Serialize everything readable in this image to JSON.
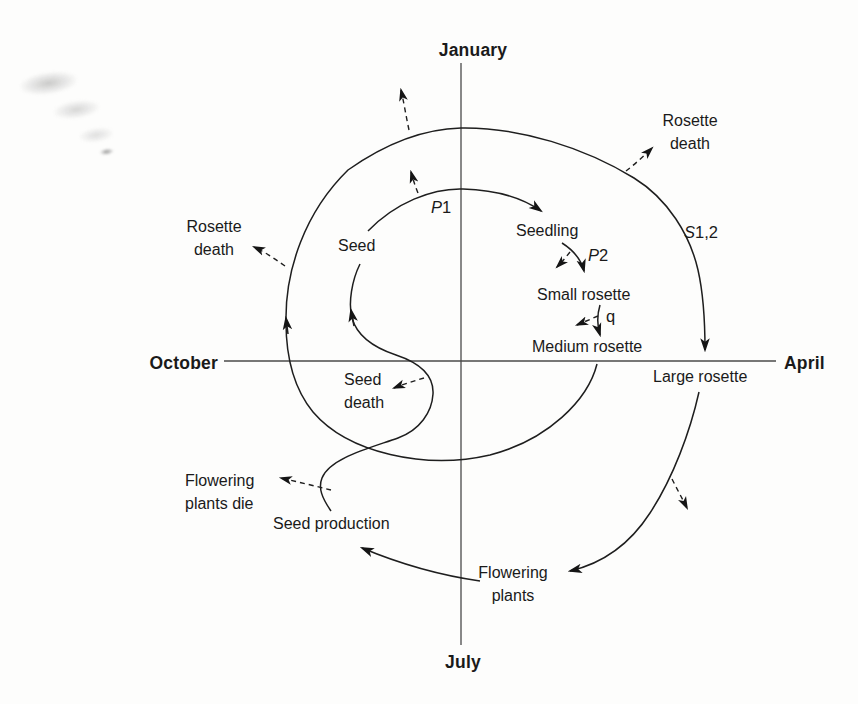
{
  "months": {
    "top": "January",
    "right": "April",
    "bottom": "July",
    "left": "October"
  },
  "stages": {
    "seed": "Seed",
    "seedling": "Seedling",
    "small_rosette": "Small rosette",
    "medium_rosette": "Medium rosette",
    "large_rosette": "Large rosette",
    "flowering_plants": "Flowering plants",
    "seed_production": "Seed production"
  },
  "transitions": {
    "p1": {
      "italic": "P",
      "normal": "1"
    },
    "p2": {
      "italic": "P",
      "normal": "2"
    },
    "q": {
      "italic": "",
      "normal": "q"
    },
    "s12": {
      "italic": "S",
      "normal": "1,2"
    }
  },
  "deaths": {
    "rosette_death_left": "Rosette death",
    "rosette_death_right": "Rosette death",
    "seed_death": "Seed death",
    "flowering_plants_die": "Flowering plants die"
  }
}
